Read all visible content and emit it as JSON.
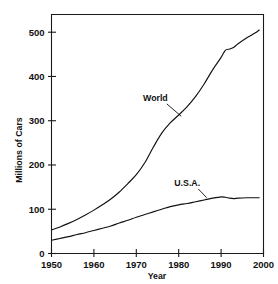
{
  "chart_data": {
    "type": "line",
    "title": "",
    "xlabel": "Year",
    "ylabel": "Millions of Cars",
    "xlim": [
      1950,
      2000
    ],
    "ylim": [
      0,
      540
    ],
    "grid": false,
    "legend_position": "inline-annotations",
    "xticks": [
      1950,
      1960,
      1970,
      1980,
      1990,
      2000
    ],
    "xtick_labels": [
      "1950",
      "1960",
      "1970",
      "1980",
      "1990",
      "2000"
    ],
    "yticks": [
      0,
      100,
      200,
      300,
      400,
      500
    ],
    "ytick_labels": [
      "0",
      "100",
      "200",
      "300",
      "400",
      "500"
    ],
    "annotations": [
      {
        "text": "World",
        "x": 1974.5,
        "y": 345
      },
      {
        "text": "U.S.A.",
        "x": 1982.0,
        "y": 152
      }
    ],
    "series": [
      {
        "name": "World",
        "x": [
          1950,
          1952,
          1954,
          1956,
          1958,
          1960,
          1962,
          1964,
          1966,
          1968,
          1970,
          1972,
          1974,
          1976,
          1978,
          1980,
          1982,
          1984,
          1986,
          1988,
          1990,
          1991,
          1992,
          1993,
          1994,
          1996,
          1998,
          1999
        ],
        "values": [
          53,
          60,
          68,
          77,
          87,
          98,
          110,
          123,
          139,
          158,
          178,
          205,
          240,
          272,
          295,
          313,
          332,
          355,
          383,
          415,
          443,
          459,
          462,
          466,
          474,
          487,
          498,
          505
        ]
      },
      {
        "name": "U.S.A.",
        "x": [
          1950,
          1952,
          1954,
          1956,
          1958,
          1960,
          1962,
          1964,
          1966,
          1968,
          1970,
          1972,
          1974,
          1976,
          1978,
          1980,
          1982,
          1984,
          1986,
          1988,
          1990,
          1991,
          1992,
          1993,
          1994,
          1996,
          1998,
          1999
        ],
        "values": [
          30,
          34,
          38,
          43,
          47,
          52,
          57,
          62,
          69,
          75,
          82,
          88,
          94,
          100,
          106,
          110,
          113,
          117,
          121,
          125,
          128,
          127,
          125,
          124,
          125,
          126,
          126,
          126
        ]
      }
    ]
  }
}
